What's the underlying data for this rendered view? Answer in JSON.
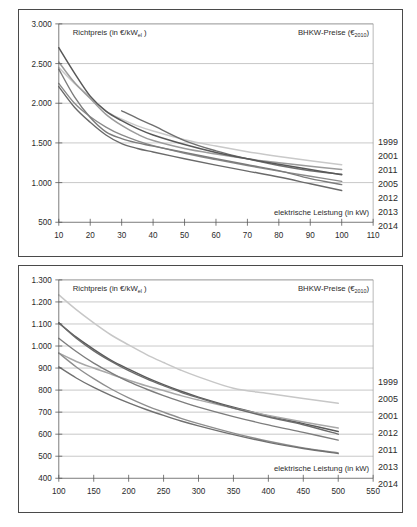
{
  "figure": {
    "background_color": "#ffffff",
    "frame_color": "#4a4a4a"
  },
  "charts": [
    {
      "id": "top",
      "y_caption_main": "Richtpreis (in €/kW",
      "y_caption_sub": "el",
      "y_caption_tail": ")",
      "corner_caption_main": "BHKW-Preise (€",
      "corner_caption_sub": "2010",
      "corner_caption_tail": ")",
      "x_caption": "elektrische Leistung (in kW)",
      "legend": [
        "1999",
        "2001",
        "2011",
        "2005",
        "2012",
        "2013",
        "2014"
      ]
    },
    {
      "id": "bottom",
      "y_caption_main": "Richtpreis (in €/kW",
      "y_caption_sub": "el",
      "y_caption_tail": ")",
      "corner_caption_main": "BHKW-Preise (€",
      "corner_caption_sub": "2010",
      "corner_caption_tail": ")",
      "x_caption": "elektrische Leistung (in kW)",
      "legend": [
        "1999",
        "2005",
        "2001",
        "2012",
        "2011",
        "2013",
        "2014"
      ]
    }
  ],
  "chart_data": [
    {
      "type": "line",
      "title": "BHKW-Preise (€2010) – kleine Leistungsklasse",
      "xlabel": "elektrische Leistung (in kW)",
      "ylabel": "Richtpreis (in €/kWel)",
      "xlim": [
        10,
        110
      ],
      "ylim": [
        500,
        3000
      ],
      "xticks": [
        10,
        20,
        30,
        40,
        50,
        60,
        70,
        80,
        90,
        100,
        110
      ],
      "ytick_labels": [
        "500",
        "1.000",
        "1.500",
        "2.000",
        "2.500",
        "3.000"
      ],
      "yticks": [
        500,
        1000,
        1500,
        2000,
        2500,
        3000
      ],
      "grid": "horizontal",
      "legend_position": "right-outside",
      "series": [
        {
          "name": "1999",
          "color": "#c9c9c9",
          "width": 1.5,
          "x": [
            10,
            15,
            20,
            25,
            30,
            35,
            40,
            50,
            60,
            70,
            80,
            90,
            100
          ],
          "values": [
            2450,
            2250,
            2080,
            1900,
            1800,
            1715,
            1650,
            1540,
            1460,
            1390,
            1330,
            1275,
            1225
          ]
        },
        {
          "name": "2001",
          "color": "#9b9b9b",
          "width": 1.5,
          "x": [
            10,
            15,
            20,
            25,
            30,
            35,
            40,
            50,
            60,
            70,
            80,
            90,
            100
          ],
          "values": [
            2520,
            2260,
            2060,
            1860,
            1720,
            1610,
            1530,
            1430,
            1360,
            1300,
            1250,
            1205,
            1165
          ]
        },
        {
          "name": "2011",
          "color": "#6f6f6f",
          "width": 1.4,
          "x": [
            30,
            35,
            40,
            50,
            60,
            70,
            80,
            90,
            100
          ],
          "values": [
            1905,
            1810,
            1720,
            1530,
            1400,
            1300,
            1215,
            1150,
            1105
          ]
        },
        {
          "name": "2005",
          "color": "#585858",
          "width": 1.5,
          "x": [
            10,
            15,
            20,
            25,
            30,
            35,
            40,
            50,
            60,
            70,
            80,
            90,
            100
          ],
          "values": [
            2700,
            2380,
            2090,
            1900,
            1780,
            1680,
            1600,
            1480,
            1380,
            1300,
            1230,
            1165,
            1100
          ]
        },
        {
          "name": "2012",
          "color": "#8a8a8a",
          "width": 1.4,
          "x": [
            10,
            15,
            20,
            25,
            30,
            35,
            40,
            50,
            60,
            70,
            80,
            90,
            100
          ],
          "values": [
            2250,
            2000,
            1830,
            1700,
            1600,
            1525,
            1465,
            1370,
            1290,
            1215,
            1145,
            1080,
            1015
          ]
        },
        {
          "name": "2013",
          "color": "#7b7b7b",
          "width": 1.4,
          "x": [
            10,
            15,
            20,
            25,
            30,
            35,
            40,
            50,
            60,
            70,
            80,
            90,
            100
          ],
          "values": [
            2430,
            2080,
            1820,
            1640,
            1555,
            1500,
            1460,
            1380,
            1300,
            1225,
            1150,
            1050,
            975
          ]
        },
        {
          "name": "2014",
          "color": "#6a6a6a",
          "width": 1.4,
          "x": [
            10,
            15,
            20,
            25,
            30,
            35,
            40,
            50,
            60,
            70,
            80,
            90,
            100
          ],
          "values": [
            2210,
            1950,
            1760,
            1600,
            1490,
            1430,
            1385,
            1300,
            1220,
            1145,
            1070,
            985,
            900
          ]
        }
      ]
    },
    {
      "type": "line",
      "title": "BHKW-Preise (€2010) – große Leistungsklasse",
      "xlabel": "elektrische Leistung (in kW)",
      "ylabel": "Richtpreis (in €/kWel)",
      "xlim": [
        100,
        550
      ],
      "ylim": [
        400,
        1300
      ],
      "xticks": [
        100,
        150,
        200,
        250,
        300,
        350,
        400,
        450,
        500,
        550
      ],
      "ytick_labels": [
        "400",
        "500",
        "600",
        "700",
        "800",
        "900",
        "1.000",
        "1.100",
        "1.200",
        "1.300"
      ],
      "yticks": [
        400,
        500,
        600,
        700,
        800,
        900,
        1000,
        1100,
        1200,
        1300
      ],
      "grid": "horizontal",
      "legend_position": "right-outside",
      "series": [
        {
          "name": "1999",
          "color": "#c7c7c7",
          "width": 1.5,
          "x": [
            100,
            125,
            150,
            175,
            200,
            225,
            250,
            275,
            300,
            350,
            400,
            450,
            500
          ],
          "values": [
            1232,
            1165,
            1105,
            1050,
            1005,
            962,
            925,
            890,
            860,
            808,
            785,
            762,
            740
          ]
        },
        {
          "name": "2005",
          "color": "#5a5a5a",
          "width": 1.5,
          "x": [
            100,
            125,
            150,
            175,
            200,
            225,
            250,
            275,
            300,
            350,
            400,
            450,
            500
          ],
          "values": [
            1105,
            1040,
            985,
            935,
            895,
            858,
            825,
            795,
            768,
            722,
            683,
            648,
            612
          ]
        },
        {
          "name": "2001",
          "color": "#a8a8a8",
          "width": 1.5,
          "x": [
            100,
            125,
            150,
            175,
            200,
            225,
            250,
            275,
            300,
            350,
            400,
            450,
            500
          ],
          "values": [
            968,
            930,
            900,
            872,
            845,
            820,
            798,
            775,
            755,
            718,
            685,
            655,
            628
          ]
        },
        {
          "name": "2012",
          "color": "#6b6b6b",
          "width": 1.4,
          "x": [
            100,
            125,
            150,
            175,
            200,
            225,
            250,
            275,
            300,
            350,
            400,
            450,
            500
          ],
          "values": [
            1105,
            1035,
            978,
            930,
            888,
            852,
            820,
            790,
            765,
            718,
            678,
            643,
            600
          ]
        },
        {
          "name": "2011",
          "color": "#7d7d7d",
          "width": 1.4,
          "x": [
            100,
            125,
            150,
            175,
            200,
            225,
            250,
            275,
            300,
            350,
            400,
            450,
            500
          ],
          "values": [
            1035,
            975,
            922,
            878,
            838,
            805,
            775,
            748,
            723,
            680,
            642,
            608,
            573
          ]
        },
        {
          "name": "2013",
          "color": "#8e8e8e",
          "width": 1.4,
          "x": [
            100,
            125,
            150,
            175,
            200,
            225,
            250,
            275,
            300,
            350,
            400,
            450,
            500
          ],
          "values": [
            968,
            905,
            852,
            805,
            765,
            730,
            700,
            672,
            648,
            605,
            568,
            538,
            515
          ]
        },
        {
          "name": "2014",
          "color": "#707070",
          "width": 1.4,
          "x": [
            100,
            125,
            150,
            175,
            200,
            225,
            250,
            275,
            300,
            350,
            400,
            450,
            500
          ],
          "values": [
            905,
            855,
            812,
            775,
            742,
            712,
            685,
            660,
            638,
            598,
            563,
            535,
            512
          ]
        }
      ]
    }
  ]
}
